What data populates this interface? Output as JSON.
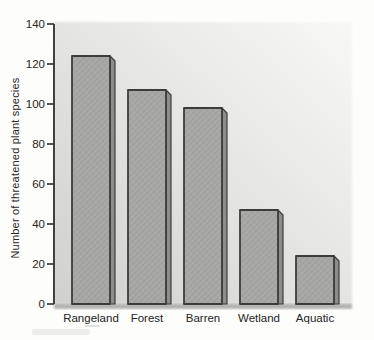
{
  "chart_data": {
    "type": "bar",
    "title": "",
    "categories": [
      "Rangeland",
      "Forest",
      "Barren",
      "Wetland",
      "Aquatic"
    ],
    "values": [
      124,
      107,
      98,
      47,
      24
    ],
    "xlabel": "",
    "ylabel": "Number of threatened plant species",
    "ylim": [
      0,
      140
    ],
    "yticks": [
      0,
      20,
      40,
      60,
      80,
      100,
      120,
      140
    ],
    "grid": false,
    "legend": "none",
    "colors": {
      "bar_face": "#a7a7a5",
      "bar_side": "#8d8d8b",
      "bar_outline": "#3c3c3a",
      "panel_top": "#f8f8f6",
      "panel_mid": "#e6e6e4",
      "panel_bottom": "#d0d0ce",
      "baseline_band": "#b3b3b1",
      "axis": "#2e2e2c",
      "text": "#242424",
      "page_bg": "#fdfdfb"
    }
  }
}
